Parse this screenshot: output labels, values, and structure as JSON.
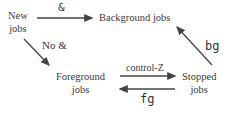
{
  "nodes": {
    "new_jobs": {
      "line1": "New",
      "line2": "jobs"
    },
    "background_jobs": {
      "label": "Background jobs"
    },
    "foreground_jobs": {
      "line1": "Foreground",
      "line2": "jobs"
    },
    "stopped_jobs": {
      "line1": "Stopped",
      "line2": "jobs"
    }
  },
  "edges": {
    "new_to_background": {
      "label": "&"
    },
    "new_to_foreground": {
      "label": "No &"
    },
    "foreground_to_stopped": {
      "label": "control-Z"
    },
    "stopped_to_foreground": {
      "label": "fg"
    },
    "stopped_to_background": {
      "label": "bg"
    }
  },
  "colors": {
    "text": "#3a3a3a",
    "arrow": "#444444",
    "background": "#ffffff"
  }
}
